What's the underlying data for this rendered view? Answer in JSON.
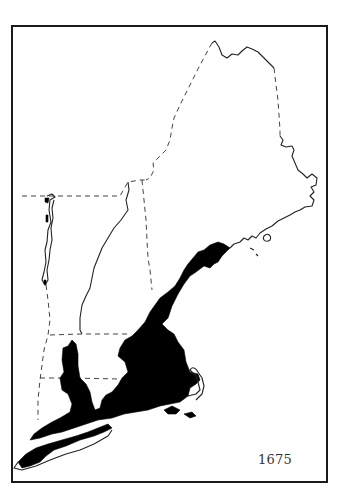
{
  "map": {
    "title_year": "1675",
    "subject": "New England settled area",
    "colors": {
      "settled_area": "#000000",
      "coastline": "#222222",
      "state_borders": "#444444",
      "background": "#ffffff",
      "frame": "#1a1a1a"
    },
    "legend": {
      "year": "1675"
    }
  }
}
